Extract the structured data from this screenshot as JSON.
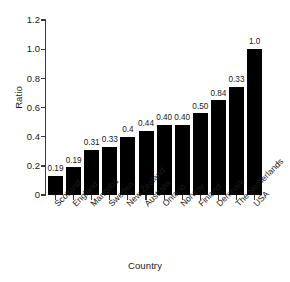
{
  "chart_data": {
    "type": "bar",
    "title": "",
    "xlabel": "Country",
    "ylabel": "Ratio",
    "categories": [
      "Scotland",
      "England",
      "Manitoba",
      "Sweden",
      "New Zealand",
      "Australia",
      "Ontario",
      "Norway",
      "Finland",
      "Denmark",
      "The Netherlands",
      "USA"
    ],
    "values": [
      0.13,
      0.19,
      0.31,
      0.33,
      0.4,
      0.44,
      0.48,
      0.48,
      0.56,
      0.65,
      0.74,
      1.0
    ],
    "data_labels": [
      "0.19",
      "0.19",
      "0.31",
      "0.33",
      "0.4",
      "0.44",
      "0.40",
      "0.40",
      "0.50",
      "0.84",
      "0.33",
      "1.0"
    ],
    "ylim": [
      0,
      1.2
    ],
    "yticks": [
      0,
      0.2,
      0.4,
      0.6,
      0.8,
      1.0,
      1.2
    ],
    "ytick_labels": [
      "0",
      "0.2",
      "0.4",
      "0.6",
      "0.8",
      "1.0",
      "1.2"
    ],
    "grid": false,
    "legend": "none",
    "bar_color": "#000000",
    "axis_color": "#3a3a3a",
    "background": "#ffffff"
  },
  "axes": {
    "y_title": "Ratio",
    "x_title": "Country"
  }
}
